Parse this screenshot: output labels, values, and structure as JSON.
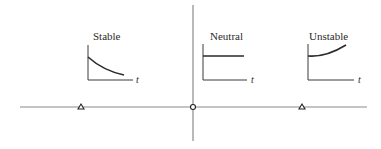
{
  "diagram": {
    "colors": {
      "axis": "#8a8a8a",
      "inset_axis": "#3a3a3a",
      "curve": "#2a2a2a",
      "background": "#ffffff"
    },
    "main_axes": {
      "horizontal": {
        "x1": 20,
        "y": 107,
        "x2": 367
      },
      "vertical": {
        "x": 193,
        "y1": 5,
        "y2": 141
      }
    },
    "markers": [
      {
        "name": "stable-marker",
        "x": 81,
        "y": 107,
        "shape": "triangle"
      },
      {
        "name": "neutral-marker",
        "x": 193,
        "y": 107,
        "shape": "circle"
      },
      {
        "name": "unstable-marker",
        "x": 302,
        "y": 107,
        "shape": "triangle"
      }
    ],
    "insets": [
      {
        "id": "stable",
        "title": "Stable",
        "time_label": "t",
        "title_pos": [
          93,
          40
        ],
        "origin": [
          88,
          80
        ],
        "y_top": 45,
        "x_end": 133,
        "t_pos": [
          136,
          83
        ],
        "curve": "M88,57 C98,66 110,72 124,75",
        "behavior": "decaying"
      },
      {
        "id": "neutral",
        "title": "Neutral",
        "time_label": "t",
        "title_pos": [
          210,
          40
        ],
        "origin": [
          203,
          80
        ],
        "y_top": 44,
        "x_end": 247,
        "t_pos": [
          251,
          83
        ],
        "curve": "M203,56 L244,56",
        "behavior": "constant"
      },
      {
        "id": "unstable",
        "title": "Unstable",
        "time_label": "t",
        "title_pos": [
          309,
          40
        ],
        "origin": [
          308,
          80
        ],
        "y_top": 44,
        "x_end": 354,
        "t_pos": [
          358,
          83
        ],
        "curve": "M308,56 C320,57 333,53 346,45",
        "behavior": "growing"
      }
    ]
  }
}
